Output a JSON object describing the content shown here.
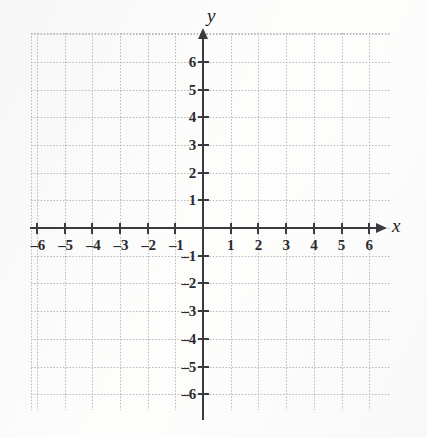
{
  "figure": {
    "kind": "cartesian-coordinate-plane",
    "background_color": "#fdfdfc",
    "grid_color": "#b9b9bd",
    "axis_color": "#3b3b3f",
    "label_color": "#2b2b2f"
  },
  "axes": {
    "x_label": "x",
    "y_label": "y"
  },
  "chart_data": {
    "type": "scatter",
    "title": "",
    "subtitle": "",
    "xlabel": "x",
    "ylabel": "y",
    "xlim": [
      -6.2,
      6.8
    ],
    "ylim": [
      -6.8,
      6.8
    ],
    "xticks": [
      -6,
      -5,
      -4,
      -3,
      -2,
      -1,
      1,
      2,
      3,
      4,
      5,
      6
    ],
    "yticks": [
      -6,
      -5,
      -4,
      -3,
      -2,
      -1,
      1,
      2,
      3,
      4,
      5,
      6
    ],
    "xticklabels": [
      "–6",
      "–5",
      "–4",
      "–3",
      "–2",
      "–1",
      "1",
      "2",
      "3",
      "4",
      "5",
      "6"
    ],
    "yticklabels": [
      "–6",
      "–5",
      "–4",
      "–3",
      "–2",
      "–1",
      "1",
      "2",
      "3",
      "4",
      "5",
      "6"
    ],
    "grid": true,
    "grid_style": "dotted",
    "grid_spacing": 1,
    "legend": null,
    "legend_position": "none",
    "series": [],
    "annotations": []
  },
  "geometry": {
    "origin_x": 203,
    "origin_y": 228,
    "unit_px": 27.7,
    "grid_left": 31,
    "grid_right": 390,
    "grid_top": 33,
    "grid_bottom": 410,
    "x_axis_start": 30,
    "x_axis_end": 376,
    "y_axis_top": 38,
    "y_axis_bottom": 420
  }
}
